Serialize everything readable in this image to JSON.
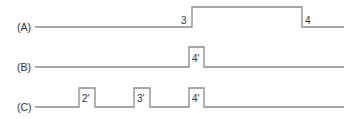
{
  "diagram": {
    "type": "timing-diagram",
    "colors": {
      "line": "#8a8a8a",
      "text": "#333333",
      "background": "#ffffff"
    },
    "signals": [
      {
        "label": "(A)",
        "baseline_y": 27,
        "high_y": 7,
        "start_x": 35,
        "end_x": 344,
        "pulses": [
          {
            "x0": 192,
            "x1": 302,
            "label_rise": "3",
            "label_fall": "4"
          }
        ]
      },
      {
        "label": "(B)",
        "baseline_y": 67,
        "high_y": 47,
        "start_x": 35,
        "end_x": 344,
        "pulses": [
          {
            "x0": 189,
            "x1": 204,
            "label": "4'"
          }
        ]
      },
      {
        "label": "(C)",
        "baseline_y": 107,
        "high_y": 88,
        "start_x": 35,
        "end_x": 344,
        "pulses": [
          {
            "x0": 79,
            "x1": 95,
            "label": "2'"
          },
          {
            "x0": 134,
            "x1": 150,
            "label": "3'"
          },
          {
            "x0": 189,
            "x1": 204,
            "label": "4'"
          }
        ]
      }
    ]
  }
}
